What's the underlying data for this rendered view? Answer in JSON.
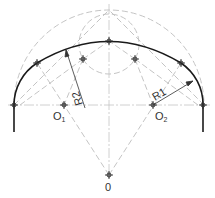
{
  "diagram": {
    "type": "basket-handle-arch-construction",
    "colors": {
      "arc": "#1a1a1a",
      "construction": "#b8b8b8",
      "centerline": "#c4c4c4",
      "dimension": "#333333",
      "text": "#333333",
      "marker": "#2a2a2a"
    },
    "points": {
      "O": {
        "label": "0",
        "x": 109,
        "y": 175
      },
      "O1": {
        "label": "O",
        "sub": "1",
        "x": 64,
        "y": 105
      },
      "O2": {
        "label": "O",
        "sub": "2",
        "x": 153,
        "y": 105
      }
    },
    "labels": {
      "center": "0",
      "o1_main": "O",
      "o1_sub": "1",
      "o2_main": "O",
      "o2_sub": "2",
      "r1": "R1",
      "r2": "R2"
    },
    "dimensions": [
      {
        "name": "R1",
        "from": [
          153,
          105
        ],
        "to": [
          193,
          81
        ]
      },
      {
        "name": "R2",
        "from": [
          85,
          108
        ],
        "to": [
          66,
          50
        ]
      }
    ]
  }
}
